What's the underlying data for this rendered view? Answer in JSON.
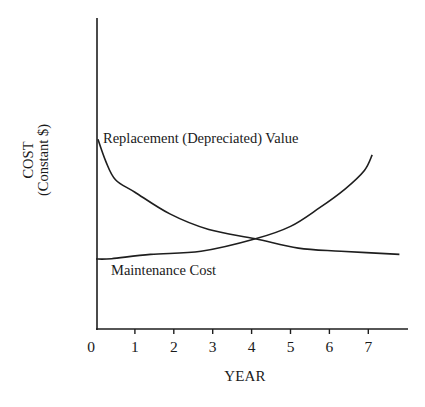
{
  "chart_data": {
    "type": "line",
    "title": "",
    "xlabel": "YEAR",
    "ylabel": "COST (Constant $)",
    "ylabel_lines": [
      "COST",
      "(Constant $)"
    ],
    "x_ticks": [
      0,
      1,
      2,
      3,
      4,
      5,
      6,
      7
    ],
    "xlim": [
      0,
      8
    ],
    "ylim": [
      0,
      100
    ],
    "y_ticks": [],
    "grid": false,
    "legend": "inline curve labels",
    "annotations": [
      {
        "text": "Replacement (Depreciated) Value",
        "near_series": "Replacement (Depreciated) Value",
        "x": 0.2,
        "y": 61
      },
      {
        "text": "Maintenance Cost",
        "near_series": "Maintenance Cost",
        "x": 0.4,
        "y": 18
      }
    ],
    "series": [
      {
        "name": "Replacement (Depreciated) Value",
        "x": [
          0.05,
          0.25,
          0.5,
          1.0,
          1.9,
          2.9,
          4.1,
          5.2,
          6.3,
          7.8
        ],
        "values": [
          61,
          54,
          48,
          44,
          37,
          32,
          29,
          26,
          25,
          24
        ]
      },
      {
        "name": "Maintenance Cost",
        "x": [
          0.0,
          0.4,
          1.4,
          2.7,
          4.1,
          5.0,
          5.75,
          6.4,
          6.9,
          7.1
        ],
        "values": [
          22.5,
          22.6,
          24,
          25,
          29,
          33,
          39,
          45,
          51,
          56
        ]
      }
    ],
    "intersection": {
      "x": 4.1,
      "y": 29
    }
  },
  "labels": {
    "ylabel_line1": "COST",
    "ylabel_line2": "(Constant $)",
    "xlabel": "YEAR",
    "replacement": "Replacement (Depreciated) Value",
    "maintenance": "Maintenance Cost",
    "ticks": [
      "0",
      "1",
      "2",
      "3",
      "4",
      "5",
      "6",
      "7"
    ]
  },
  "style": {
    "line_color": "#1e1e1e",
    "background": "#ffffff"
  }
}
